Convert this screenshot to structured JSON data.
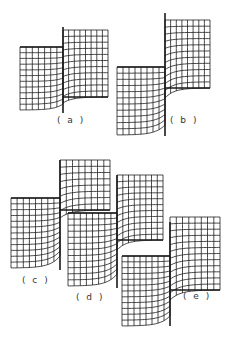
{
  "figure": {
    "line_color": "#1a1a1a",
    "background": "#ffffff",
    "panels": [
      {
        "id": "a",
        "label": "( a )",
        "left": {
          "x": 20,
          "y": 47,
          "w": 43,
          "h": 63
        },
        "right": {
          "x": 63,
          "y": 30,
          "w": 45,
          "h": 67
        },
        "interface": {
          "x": 63,
          "y1": 27,
          "y2": 113
        },
        "label_pos": {
          "x": 57,
          "y": 115
        }
      },
      {
        "id": "b",
        "label": "( b )",
        "left": {
          "x": 117,
          "y": 67,
          "w": 48,
          "h": 68
        },
        "right": {
          "x": 165,
          "y": 20,
          "w": 45,
          "h": 68
        },
        "interface": {
          "x": 165,
          "y1": 13,
          "y2": 136
        },
        "label_pos": {
          "x": 170,
          "y": 115
        }
      },
      {
        "id": "c",
        "label": "( c )",
        "left": {
          "x": 11,
          "y": 198,
          "w": 49,
          "h": 70
        },
        "right": {
          "x": 60,
          "y": 160,
          "w": 50,
          "h": 50
        },
        "interface": {
          "x": 60,
          "y1": 160,
          "y2": 270
        },
        "label_pos": {
          "x": 22,
          "y": 276
        }
      },
      {
        "id": "d",
        "label": "( d )",
        "left": {
          "x": 68,
          "y": 213,
          "w": 49,
          "h": 73
        },
        "right": {
          "x": 117,
          "y": 175,
          "w": 46,
          "h": 65
        },
        "interface": {
          "x": 117,
          "y1": 175,
          "y2": 288
        },
        "label_pos": {
          "x": 76,
          "y": 293
        }
      },
      {
        "id": "e",
        "label": "( e )",
        "left": {
          "x": 122,
          "y": 256,
          "w": 48,
          "h": 70
        },
        "right": {
          "x": 170,
          "y": 217,
          "w": 50,
          "h": 73
        },
        "interface": {
          "x": 170,
          "y1": 222,
          "y2": 326
        },
        "label_pos": {
          "x": 183,
          "y": 292
        }
      }
    ]
  }
}
